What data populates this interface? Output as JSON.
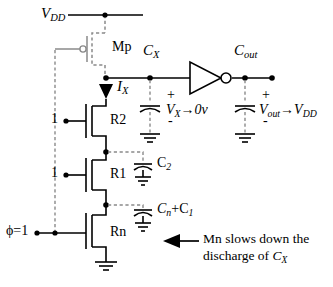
{
  "diagram": {
    "type": "circuit-schematic",
    "colors": {
      "wire": "#000000",
      "dashed_gray": "#8a8a8a",
      "background": "#ffffff"
    }
  },
  "labels": {
    "vdd": "V",
    "vdd_sub": "DD",
    "mp": "Mp",
    "ix": "I",
    "ix_sub": "X",
    "r2": "R2",
    "r1": "R1",
    "rn": "Rn",
    "gate_one_upper": "1",
    "gate_one_lower": "1",
    "phi_clock": "ϕ=1",
    "cx": "C",
    "cx_sub": "X",
    "cout": "C",
    "cout_sub": "out",
    "c2": "C",
    "c2_sub": "2",
    "cn_c1": "C",
    "cn_sub": "n",
    "cn_plus": "+C",
    "c1_sub": "1",
    "vx_annotation": "V",
    "vx_sub": "X",
    "vx_arrow": "→0v",
    "vout_annotation": "V",
    "vout_sub": "out",
    "vout_arrow": "→V",
    "vout_arrow_sub": "DD",
    "plus_cx": "+",
    "minus_cx": "-",
    "plus_cout": "+",
    "minus_cout": "-",
    "note_line1": "Mn slows down the",
    "note_line2_a": "discharge of ",
    "note_line2_b": "C",
    "note_line2_sub": "X"
  },
  "components": {
    "transistors": [
      {
        "name": "Mp",
        "kind": "pmos",
        "style": "dashed-gray"
      },
      {
        "name": "R2",
        "kind": "nmos",
        "style": "solid"
      },
      {
        "name": "R1",
        "kind": "nmos",
        "style": "solid"
      },
      {
        "name": "Rn",
        "kind": "nmos",
        "style": "solid"
      }
    ],
    "capacitors": [
      {
        "name": "C_X",
        "style": "dashed-lead"
      },
      {
        "name": "C_out",
        "style": "dashed-lead"
      },
      {
        "name": "C_2",
        "style": "dashed-lead"
      },
      {
        "name": "C_n+C_1",
        "style": "dashed-lead"
      }
    ],
    "inverter": {
      "name": "inverter",
      "has_bubble": true
    },
    "grounds": 5,
    "current_arrow": {
      "name": "I_X",
      "direction": "down"
    },
    "note_arrow": {
      "direction": "left"
    }
  }
}
